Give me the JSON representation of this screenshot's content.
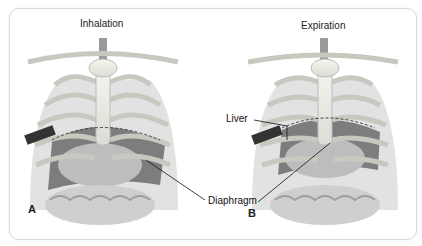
{
  "panels": [
    {
      "letter": "A",
      "title": "Inhalation"
    },
    {
      "letter": "B",
      "title": "Expiration"
    }
  ],
  "labels": {
    "liver": "Liver",
    "diaphragm": "Diaphragm"
  }
}
